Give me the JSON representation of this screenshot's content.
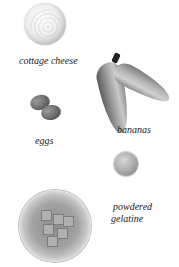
{
  "items": [
    {
      "name": "cottage-cheese",
      "label": "cottage cheese"
    },
    {
      "name": "eggs",
      "label": "eggs"
    },
    {
      "name": "bananas",
      "label": "bananas"
    },
    {
      "name": "powdered-gelatine",
      "label_line1": "powdered",
      "label_line2": "gelatine"
    },
    {
      "name": "jelly-bowl",
      "label": ""
    }
  ]
}
